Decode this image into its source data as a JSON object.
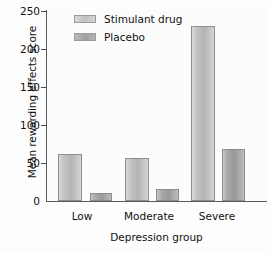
{
  "chart_data": {
    "type": "bar",
    "title": "",
    "xlabel": "Depression group",
    "ylabel": "Mean rewarding effects score",
    "categories": [
      "Low",
      "Moderate",
      "Severe"
    ],
    "series": [
      {
        "name": "Stimulant drug",
        "values": [
          62,
          57,
          229
        ],
        "color": "#c3c3c3"
      },
      {
        "name": "Placebo",
        "values": [
          11,
          16,
          68
        ],
        "color": "#9e9e9e"
      }
    ],
    "ylim": [
      0,
      250
    ],
    "yticks": [
      250,
      200,
      150,
      100,
      50,
      0
    ],
    "ytick_labels": [
      "250",
      "200",
      "150",
      "100",
      "50",
      "0"
    ],
    "grid": false,
    "legend_position": "top-center"
  },
  "axes": {
    "y_label": "Mean rewarding effects score",
    "x_label": "Depression group"
  },
  "legend": {
    "items": [
      {
        "label": "Stimulant drug",
        "swatch": "stimulant-drug-swatch"
      },
      {
        "label": "Placebo",
        "swatch": "placebo-swatch"
      }
    ]
  },
  "colors": {
    "bar_stimulant": "#c3c3c3",
    "bar_placebo": "#9e9e9e",
    "axis": "#5a5a5a",
    "text": "#111111",
    "background": "#fdfdfd"
  }
}
